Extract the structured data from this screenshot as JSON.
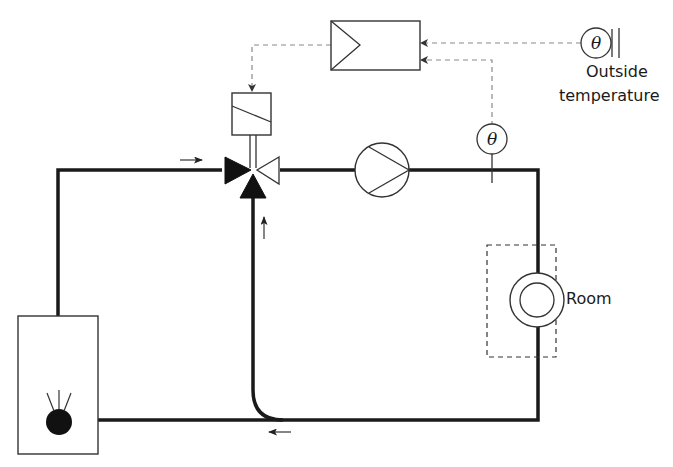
{
  "diagram": {
    "labels": {
      "outside_line1": "Outside",
      "outside_line2": "temperature",
      "room": "Room",
      "theta_symbol": "θ"
    },
    "components": [
      {
        "id": "controller",
        "name": "Controller (amplifier)"
      },
      {
        "id": "actuator",
        "name": "Valve actuator"
      },
      {
        "id": "mixing_valve",
        "name": "Three-way mixing valve"
      },
      {
        "id": "pump",
        "name": "Circulation pump"
      },
      {
        "id": "flow_sensor",
        "name": "Flow temperature sensor",
        "symbol": "θ"
      },
      {
        "id": "outside_sensor",
        "name": "Outside temperature sensor",
        "symbol": "θ"
      },
      {
        "id": "radiator",
        "name": "Radiator in room"
      },
      {
        "id": "boiler",
        "name": "Boiler with burner"
      }
    ],
    "flow_arrows": [
      "right (supply into valve)",
      "up (bypass into valve)",
      "left (return)"
    ],
    "colors": {
      "pipe": "#1a1a1a",
      "signal_line": "#8a8a8a",
      "outline": "#333333",
      "background": "#ffffff"
    }
  }
}
